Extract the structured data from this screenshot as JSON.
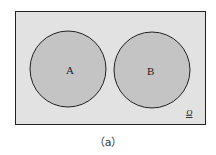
{
  "diagram": {
    "type": "venn",
    "universe_label": "Ω",
    "sets": [
      {
        "label": "A"
      },
      {
        "label": "B"
      }
    ],
    "relation": "disjoint",
    "colors": {
      "universe_fill": "#e2e2e2",
      "set_fill": "#c4c4c4",
      "stroke": "#222222"
    },
    "caption": "（a）"
  }
}
